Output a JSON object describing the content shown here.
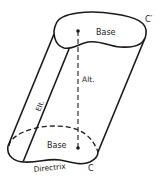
{
  "diagram": {
    "type": "oblique-cylinder",
    "stroke_color": "#1a1a1a",
    "background": "#ffffff",
    "labels": {
      "top_base": "Base",
      "bottom_base": "Base",
      "top_curve": "C′",
      "bottom_curve": "C",
      "altitude": "Alt.",
      "element": "Elt.",
      "directrix": "Directrix"
    }
  }
}
